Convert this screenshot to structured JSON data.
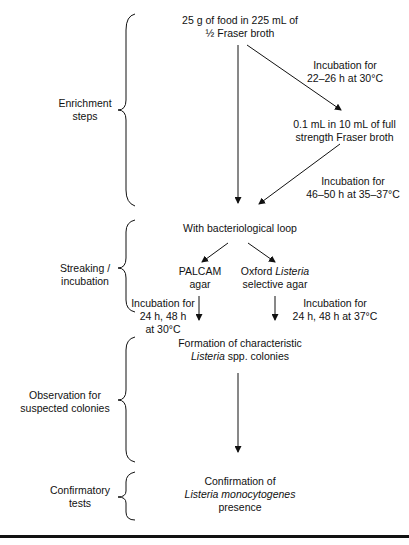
{
  "phases": [
    {
      "id": "enrichment",
      "label_lines": [
        "Enrichment",
        "steps"
      ]
    },
    {
      "id": "streaking",
      "label_lines": [
        "Streaking /",
        "incubation"
      ]
    },
    {
      "id": "observation",
      "label_lines": [
        "Observation for",
        "suspected colonies"
      ]
    },
    {
      "id": "confirmatory",
      "label_lines": [
        "Confirmatory",
        "tests"
      ]
    }
  ],
  "nodes": {
    "start": {
      "line1": "25 g of food in 225 mL of",
      "line2": "½ Fraser broth"
    },
    "full_fraser": {
      "line1": "0.1 mL in 10 mL of full",
      "line2": "strength Fraser broth"
    },
    "loop": {
      "line1": "With bacteriological loop"
    },
    "palcam": {
      "line1": "PALCAM",
      "line2": "agar"
    },
    "oxford": {
      "line1_prefix": "Oxford ",
      "line1_italic": "Listeria",
      "line2": "selective agar"
    },
    "formation": {
      "line1": "Formation of characteristic",
      "line2_italic": "Listeria",
      "line2_suffix": " spp. colonies"
    },
    "confirmation": {
      "line1": "Confirmation of",
      "line2_italic": "Listeria monocytogenes",
      "line3": "presence"
    }
  },
  "edges": {
    "start_to_full": {
      "line1": "Incubation for",
      "line2": "22–26 h at 30°C"
    },
    "full_to_loop": {
      "line1": "Incubation for",
      "line2": "46–50 h at 35–37°C"
    },
    "palcam_incubation": {
      "line1": "Incubation for",
      "line2": "24 h, 48 h",
      "line3": "at 30°C"
    },
    "oxford_incubation": {
      "line1": "Incubation for",
      "line2": "24 h, 48 h at 37°C"
    }
  },
  "colors": {
    "ink": "#111111",
    "background": "#ffffff"
  }
}
